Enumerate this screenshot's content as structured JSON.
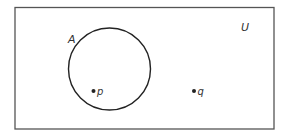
{
  "diagram": {
    "type": "venn",
    "universe": {
      "label": "U"
    },
    "sets": [
      {
        "label": "A"
      }
    ],
    "points": [
      {
        "label": "p",
        "in_set": "A"
      },
      {
        "label": "q",
        "in_set": null
      }
    ]
  },
  "colors": {
    "stroke": "#333333",
    "background": "#ffffff"
  }
}
